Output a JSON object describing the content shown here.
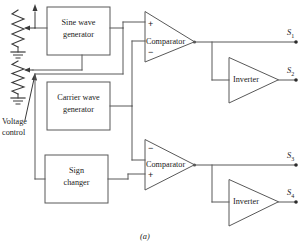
{
  "figure": {
    "caption": "(a)",
    "title_cropped": "index",
    "background_color": "#ffffff",
    "line_color": "#595959",
    "text_color": "#1a1a1a"
  },
  "blocks": [
    {
      "id": "sine-wave-generator",
      "line1": "Sine wave",
      "line2": "generator"
    },
    {
      "id": "carrier-wave-generator",
      "line1": "Carrier wave",
      "line2": "generator"
    },
    {
      "id": "sign-changer",
      "line1": "Sign",
      "line2": "changer"
    }
  ],
  "comparators": [
    {
      "id": "comparator-top",
      "label": "Comparator",
      "top_sign": "+",
      "bottom_sign": "−"
    },
    {
      "id": "comparator-bottom",
      "label": "Comparator",
      "top_sign": "−",
      "bottom_sign": "+"
    }
  ],
  "inverters": [
    {
      "id": "inverter-top",
      "label": "Inverter"
    },
    {
      "id": "inverter-bottom",
      "label": "Inverter"
    }
  ],
  "outputs": [
    {
      "id": "output-s1",
      "symbol": "S",
      "index": "1"
    },
    {
      "id": "output-s2",
      "symbol": "S",
      "index": "2"
    },
    {
      "id": "output-s3",
      "symbol": "S",
      "index": "3"
    },
    {
      "id": "output-s4",
      "symbol": "S",
      "index": "4"
    }
  ],
  "annotations": {
    "voltage_control_line1": "Voltage",
    "voltage_control_line2": "control",
    "top_annotation": "index"
  }
}
